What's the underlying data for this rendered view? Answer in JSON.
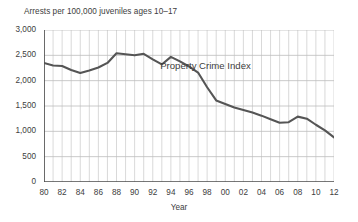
{
  "chart_data": {
    "type": "line",
    "title": "Arrests per 100,000 juveniles ages 10–17",
    "xlabel": "Year",
    "ylabel": "",
    "ylim": [
      0,
      3000
    ],
    "xlim": [
      1980,
      2012
    ],
    "ytick_values": [
      0,
      500,
      1000,
      1500,
      2000,
      2500,
      3000
    ],
    "ytick_labels": [
      "0",
      "500",
      "1,000",
      "1,500",
      "2,000",
      "2,500",
      "3,000"
    ],
    "xtick_values": [
      1980,
      1982,
      1984,
      1986,
      1988,
      1990,
      1992,
      1994,
      1996,
      1998,
      2000,
      2002,
      2004,
      2006,
      2008,
      2010,
      2012
    ],
    "xtick_labels": [
      "80",
      "82",
      "84",
      "86",
      "88",
      "90",
      "92",
      "94",
      "96",
      "98",
      "00",
      "02",
      "04",
      "06",
      "08",
      "10",
      "12"
    ],
    "grid": {
      "horizontal": true,
      "vertical": true,
      "vertical_every_years": 1
    },
    "legend": "none",
    "annotations": [
      {
        "text": "Property Crime Index",
        "x": 1999,
        "y": 2300
      }
    ],
    "series": [
      {
        "name": "Property Crime Index",
        "color": "#555555",
        "x": [
          1980,
          1981,
          1982,
          1983,
          1984,
          1985,
          1986,
          1987,
          1988,
          1989,
          1990,
          1991,
          1992,
          1993,
          1994,
          1995,
          1996,
          1997,
          1998,
          1999,
          2000,
          2001,
          2002,
          2003,
          2004,
          2005,
          2006,
          2007,
          2008,
          2009,
          2010,
          2011,
          2012
        ],
        "values": [
          2350,
          2300,
          2290,
          2210,
          2150,
          2200,
          2260,
          2350,
          2540,
          2520,
          2500,
          2530,
          2420,
          2320,
          2470,
          2380,
          2280,
          2160,
          1870,
          1610,
          1540,
          1470,
          1420,
          1370,
          1310,
          1240,
          1170,
          1180,
          1290,
          1250,
          1130,
          1020,
          880
        ]
      }
    ]
  }
}
